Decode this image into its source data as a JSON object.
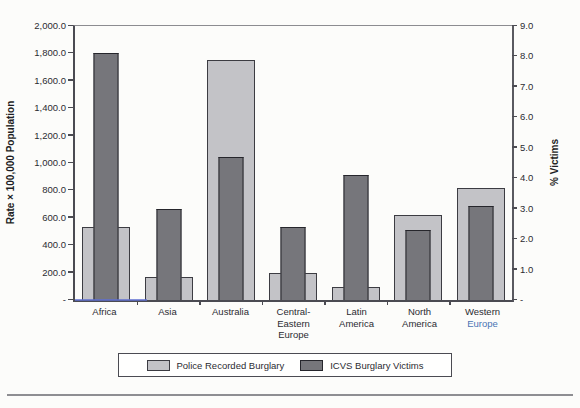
{
  "chart_data": {
    "type": "bar",
    "title": "",
    "categories": [
      "Africa",
      "Asia",
      "Australia",
      "Central-Eastern Europe",
      "Latin America",
      "North America",
      "Western Europe"
    ],
    "category_label_lines": [
      [
        "Africa"
      ],
      [
        "Asia"
      ],
      [
        "Australia"
      ],
      [
        "Central-",
        "Eastern",
        "Europe"
      ],
      [
        "Latin",
        "America"
      ],
      [
        "North",
        "America"
      ],
      [
        "Western",
        "Europe"
      ]
    ],
    "category_line_colors": {
      "6": {
        "1": "#4a74b4"
      }
    },
    "series": [
      {
        "name": "Police Recorded Burglary",
        "axis": "left",
        "color": "#c3c3c7",
        "border_color": "#3c3c42",
        "values": [
          530,
          170,
          1750,
          195,
          95,
          620,
          820
        ]
      },
      {
        "name": "ICVS Burglary Victims",
        "axis": "right",
        "color": "#76767b",
        "border_color": "#26262c",
        "values": [
          8.1,
          3.0,
          4.7,
          2.4,
          4.1,
          2.3,
          3.1
        ]
      }
    ],
    "left_axis": {
      "label": "Rate × 100,000 Population",
      "min": 0,
      "max": 2000,
      "step": 200,
      "tick_labels": [
        "2,000.0",
        "1,800.0",
        "1,600.0",
        "1,400.0",
        "1,200.0",
        "1,000.0",
        "800.0",
        "600.0",
        "400.0",
        "200.0",
        "-"
      ]
    },
    "right_axis": {
      "label": "% Victims",
      "min": 0,
      "max": 9,
      "step": 1,
      "tick_labels": [
        "9.0",
        "8.0",
        "7.0",
        "6.0",
        "5.0",
        "4.0",
        "3.0",
        "2.0",
        "1.0",
        "-"
      ]
    },
    "legend_position": "bottom",
    "grid": "top-border-only"
  }
}
